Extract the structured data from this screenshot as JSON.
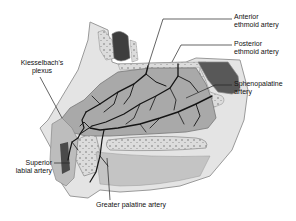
{
  "labels": {
    "anterior_ethmoid": {
      "line1": "Anterior",
      "line2": "ethmoid artery"
    },
    "posterior_ethmoid": {
      "line1": "Posterior",
      "line2": "ethmoid artery"
    },
    "sphenopalatine": {
      "line1": "Sphenopalatine",
      "line2": "artery"
    },
    "kiesselbach": {
      "line1": "Kiesselbach's",
      "line2": "plexus"
    },
    "superior_labial": {
      "line1": "Superior",
      "line2": "labial artery"
    },
    "greater_palatine": {
      "line1": "Greater palatine artery"
    }
  },
  "colors": {
    "mucosa": "#a8a8a8",
    "bone": "#d6d6d6",
    "bone_outline": "#8a8a8a",
    "vessel": "#1a1a1a",
    "sinus": "#4a4a4a",
    "leader": "#222222"
  }
}
